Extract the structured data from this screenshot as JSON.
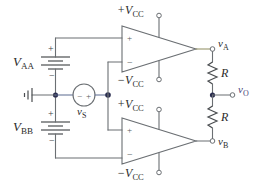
{
  "figure": {
    "kind": "circuit-schematic",
    "colors": {
      "wire": "#6b6f73",
      "wire_signal": "#5b6a8f",
      "wire_output": "#8e8b5e",
      "node": "#2a2d4f",
      "label": "#2b2b2b",
      "output_label": "#4a3f7a",
      "background": "#ffffff"
    }
  },
  "sources": {
    "vaa": {
      "name": "V",
      "sub": "AA",
      "plus": "+",
      "minus": "−"
    },
    "vbb": {
      "name": "V",
      "sub": "BB",
      "plus": "+",
      "minus": "−"
    },
    "vs": {
      "name": "v",
      "sub": "S",
      "plus": "+",
      "minus": "−"
    }
  },
  "opamps": [
    {
      "id": "top",
      "input_top_sign": "+",
      "input_bottom_sign": "−",
      "supply_positive": {
        "name": "+V",
        "sub": "CC"
      },
      "supply_negative": {
        "name": "−V",
        "sub": "CC"
      },
      "output_node": {
        "name": "v",
        "sub": "A"
      }
    },
    {
      "id": "bottom",
      "input_top_sign": "+",
      "input_bottom_sign": "−",
      "supply_positive": {
        "name": "+V",
        "sub": "CC"
      },
      "supply_negative": {
        "name": "−V",
        "sub": "CC"
      },
      "output_node": {
        "name": "v",
        "sub": "B"
      }
    }
  ],
  "resistors": [
    {
      "id": "r-top",
      "label": "R"
    },
    {
      "id": "r-bottom",
      "label": "R"
    }
  ],
  "output": {
    "name": "v",
    "sub": "O"
  },
  "ground": {
    "label": ""
  }
}
